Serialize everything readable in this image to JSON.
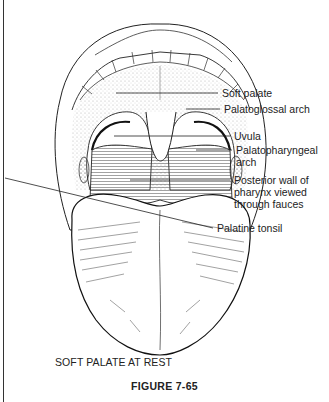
{
  "figure": {
    "caption": "SOFT PALATE AT REST",
    "number": "FIGURE 7-65"
  },
  "labels": [
    {
      "id": "soft-palate",
      "text": "Soft palate"
    },
    {
      "id": "palatoglossal-arch",
      "text": "Palatoglossal arch"
    },
    {
      "id": "uvula",
      "text": "Uvula"
    },
    {
      "id": "palatopharyngeal-arch",
      "lines": [
        "Palatopharyngeal",
        "arch"
      ]
    },
    {
      "id": "posterior-wall",
      "lines": [
        "Posterior wall of",
        "pharynx viewed",
        "through fauces"
      ]
    },
    {
      "id": "palatine-tonsil",
      "text": "Palatine tonsil"
    }
  ],
  "colors": {
    "ink": "#1a1a1a",
    "paper": "#ffffff"
  }
}
